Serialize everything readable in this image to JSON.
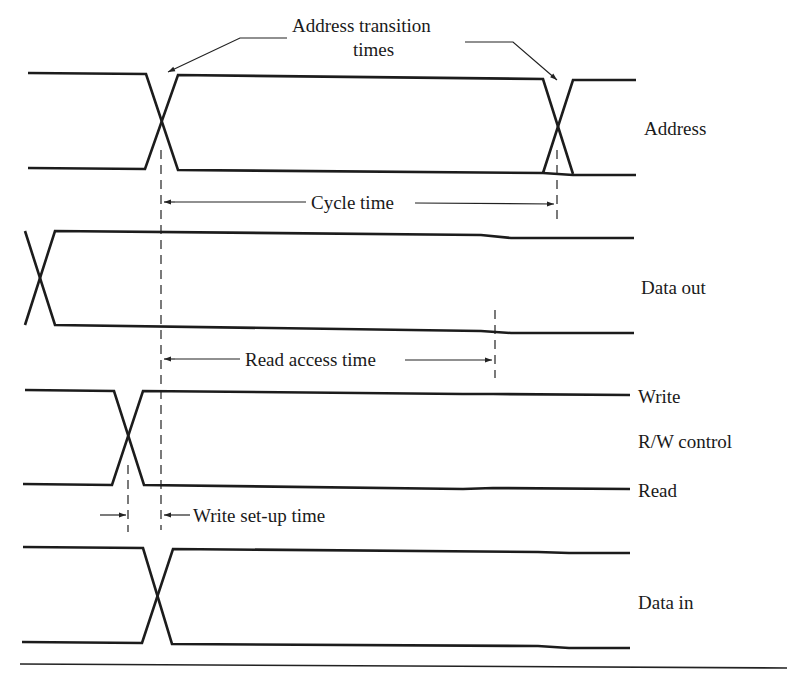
{
  "diagram": {
    "annotations": {
      "address_transition_line1": "Address transition",
      "address_transition_line2": "times",
      "cycle_time": "Cycle time",
      "read_access_time": "Read access time",
      "write_setup_time": "Write set-up time"
    },
    "signals": [
      {
        "id": "address",
        "label": "Address"
      },
      {
        "id": "data_out",
        "label": "Data out"
      },
      {
        "id": "rw_control",
        "label": "R/W control",
        "high_label": "Write",
        "low_label": "Read"
      },
      {
        "id": "data_in",
        "label": "Data in"
      }
    ],
    "colors": {
      "ink": "#1c1c1c",
      "background": "#ffffff"
    }
  }
}
